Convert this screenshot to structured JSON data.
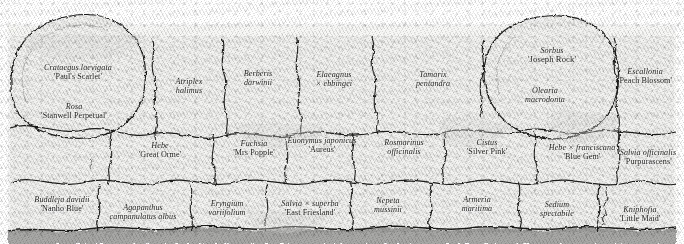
{
  "plan": {
    "title": "Planting plan — shrub and perennial border",
    "type": "garden-planting-plan",
    "width": 684,
    "height": 244,
    "style": "hand-drawn pencil-shaded plan, italic/roman serif plant labels",
    "ink_color": "#1b1b1b",
    "paper_color": "#ffffff",
    "shade_color": "#e3e3e1"
  },
  "plants": [
    {
      "id": "crataegus",
      "genus": "Crataegus laevigata",
      "cultivar": "'Paul's Scarlet'",
      "x": 78,
      "y": 72,
      "row": "back"
    },
    {
      "id": "rosa",
      "genus": "Rosa",
      "cultivar": "'Stanwell Perpetual'",
      "x": 74,
      "y": 111,
      "row": "back"
    },
    {
      "id": "atriplex",
      "genus": "Atriplex",
      "cultivar": "halimus",
      "x": 189,
      "y": 86,
      "row": "back"
    },
    {
      "id": "berberis",
      "genus": "Berberis",
      "cultivar": "darwinii",
      "x": 258,
      "y": 78,
      "row": "back"
    },
    {
      "id": "elaeagnus",
      "genus": "Elaeagnus",
      "cultivar": "× ebbingei",
      "x": 334,
      "y": 79,
      "row": "back"
    },
    {
      "id": "tamarix",
      "genus": "Tamarix",
      "cultivar": "pentandra",
      "x": 433,
      "y": 79,
      "row": "back"
    },
    {
      "id": "sorbus",
      "genus": "Sorbus",
      "cultivar": "'Joseph Rock'",
      "x": 552,
      "y": 55,
      "row": "back"
    },
    {
      "id": "olearia",
      "genus": "Olearia",
      "cultivar": "macrodonta",
      "x": 545,
      "y": 95,
      "row": "back"
    },
    {
      "id": "escallonia",
      "genus": "Escallonia",
      "cultivar": "'Peach Blossom'",
      "x": 645,
      "y": 76,
      "row": "back"
    },
    {
      "id": "hebe-orme",
      "genus": "Hebe",
      "cultivar": "'Great Orme'",
      "x": 160,
      "y": 150,
      "row": "middle"
    },
    {
      "id": "fuchsia",
      "genus": "Fuchsia",
      "cultivar": "'Mrs Popple'",
      "x": 254,
      "y": 148,
      "row": "middle"
    },
    {
      "id": "euonymus",
      "genus": "Euonymus japonicus",
      "cultivar": "'Aureus'",
      "x": 322,
      "y": 145,
      "row": "middle"
    },
    {
      "id": "rosmarinus",
      "genus": "Rosmarinus",
      "cultivar": "officinalis",
      "x": 404,
      "y": 147,
      "row": "middle"
    },
    {
      "id": "cistus",
      "genus": "Cistus",
      "cultivar": "'Silver Pink'",
      "x": 487,
      "y": 147,
      "row": "middle"
    },
    {
      "id": "hebe-fran",
      "genus": "Hebe × franciscana",
      "cultivar": "'Blue Gem'",
      "x": 582,
      "y": 152,
      "row": "middle"
    },
    {
      "id": "salvia-off",
      "genus": "Salvia officinalis",
      "cultivar": "'Purpurascens'",
      "x": 648,
      "y": 157,
      "row": "middle"
    },
    {
      "id": "buddleja",
      "genus": "Buddleja davidii",
      "cultivar": "'Nanho Blue'",
      "x": 62,
      "y": 204,
      "row": "front"
    },
    {
      "id": "agapanthus",
      "genus": "Agapanthus",
      "cultivar": "campanulatus albus",
      "x": 143,
      "y": 212,
      "row": "front"
    },
    {
      "id": "eryngium",
      "genus": "Eryngium",
      "cultivar": "variifolium",
      "x": 227,
      "y": 208,
      "row": "front"
    },
    {
      "id": "salvia-sup",
      "genus": "Salvia × superba",
      "cultivar": "'East Friesland'",
      "x": 310,
      "y": 208,
      "row": "front"
    },
    {
      "id": "nepeta",
      "genus": "Nepeta",
      "cultivar": "mussinii",
      "x": 388,
      "y": 205,
      "row": "front"
    },
    {
      "id": "armeria",
      "genus": "Armeria",
      "cultivar": "maritima",
      "x": 477,
      "y": 204,
      "row": "front"
    },
    {
      "id": "sedum",
      "genus": "Sedium",
      "cultivar": "spectabile",
      "x": 557,
      "y": 209,
      "row": "front"
    },
    {
      "id": "kniphofia",
      "genus": "Kniphofia",
      "cultivar": "'Little Maid'",
      "x": 640,
      "y": 214,
      "row": "front"
    }
  ]
}
